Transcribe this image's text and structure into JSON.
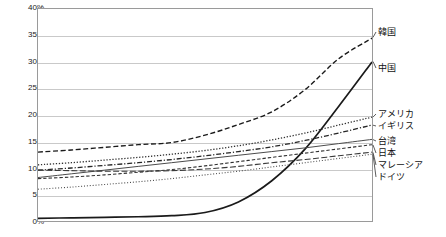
{
  "chart_data": {
    "type": "line",
    "title": "",
    "subtitle": "",
    "xlabel": "",
    "ylabel": "",
    "ylim": [
      0,
      40
    ],
    "yunit": "%",
    "ytick_labels": [
      "40%",
      "35%",
      "30%",
      "25%",
      "20%",
      "15%",
      "10%",
      "5%",
      "0%"
    ],
    "ytick_values": [
      40,
      35,
      30,
      25,
      20,
      15,
      10,
      5,
      0
    ],
    "xlim": [
      0,
      10
    ],
    "xtick_labels": [],
    "grid": "horizontal",
    "legend_position": "right-of-plot-inline",
    "x": [
      0,
      1,
      2,
      3,
      4,
      5,
      6,
      7,
      8,
      9,
      10
    ],
    "series": [
      {
        "name": "韓国",
        "style": "dashed",
        "color": "#1a1a1a",
        "width": 1.4,
        "values": [
          13.0,
          13.4,
          13.9,
          14.4,
          14.8,
          16.2,
          18.2,
          20.6,
          24.8,
          30.6,
          34.5
        ]
      },
      {
        "name": "中国",
        "style": "solid",
        "color": "#1a1a1a",
        "width": 1.7,
        "values": [
          0.5,
          0.6,
          0.7,
          0.8,
          1.0,
          1.6,
          3.6,
          7.6,
          13.6,
          21.6,
          30.0
        ]
      },
      {
        "name": "アメリカ",
        "style": "dotted",
        "color": "#303030",
        "width": 1.3,
        "values": [
          10.6,
          11.0,
          11.5,
          12.0,
          12.6,
          13.3,
          14.2,
          15.3,
          16.6,
          18.1,
          19.6
        ]
      },
      {
        "name": "イギリス",
        "style": "dashdot",
        "color": "#262626",
        "width": 1.3,
        "values": [
          9.6,
          10.0,
          10.5,
          11.0,
          11.6,
          12.3,
          13.1,
          14.0,
          15.2,
          16.6,
          18.1
        ]
      },
      {
        "name": "台湾",
        "style": "solid-thin",
        "color": "#4a4a4a",
        "width": 1.0,
        "values": [
          8.2,
          8.9,
          9.6,
          10.3,
          11.0,
          11.7,
          12.4,
          13.1,
          13.8,
          14.6,
          15.4
        ]
      },
      {
        "name": "日本",
        "style": "dashed-fine",
        "color": "#303030",
        "width": 1.1,
        "values": [
          8.0,
          8.3,
          8.7,
          9.2,
          9.7,
          10.4,
          11.2,
          12.0,
          12.8,
          13.6,
          14.4
        ]
      },
      {
        "name": "マレーシア",
        "style": "dashed-long",
        "color": "#3a3a3a",
        "width": 1.1,
        "values": [
          9.6,
          9.5,
          9.4,
          9.4,
          9.5,
          9.8,
          10.3,
          11.0,
          11.6,
          12.3,
          13.0
        ]
      },
      {
        "name": "ドイツ",
        "style": "dotted-fine",
        "color": "#4a4a4a",
        "width": 1.1,
        "values": [
          6.0,
          6.4,
          6.9,
          7.4,
          8.0,
          8.7,
          9.4,
          10.2,
          11.0,
          11.8,
          12.6
        ]
      }
    ],
    "label_anchors": [
      {
        "name": "韓国",
        "y_pct": 34.5,
        "label_y": 32
      },
      {
        "name": "中国",
        "y_pct": 30.0,
        "label_y": 68
      },
      {
        "name": "アメリカ",
        "y_pct": 19.6,
        "label_y": 114
      },
      {
        "name": "イギリス",
        "y_pct": 18.1,
        "label_y": 126
      },
      {
        "name": "台湾",
        "y_pct": 15.4,
        "label_y": 141
      },
      {
        "name": "日本",
        "y_pct": 14.4,
        "label_y": 153
      },
      {
        "name": "マレーシア",
        "y_pct": 13.0,
        "label_y": 165
      },
      {
        "name": "ドイツ",
        "y_pct": 12.6,
        "label_y": 177
      }
    ]
  }
}
